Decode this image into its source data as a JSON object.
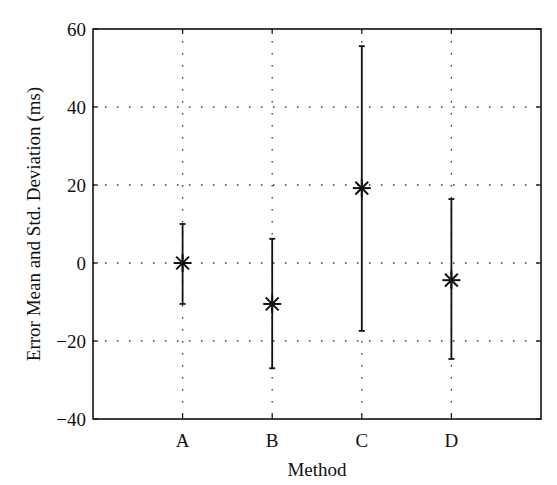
{
  "chart_data": {
    "type": "errorbar",
    "title": "",
    "xlabel": "Method",
    "ylabel": "Error Mean and Std. Deviation (ms)",
    "categories": [
      "A",
      "B",
      "C",
      "D"
    ],
    "series": [
      {
        "name": "Error",
        "marker": "asterisk",
        "mean": [
          0,
          -10.5,
          19.2,
          -4.4
        ],
        "upper": [
          10,
          6.2,
          55.6,
          16.4
        ],
        "lower": [
          -10.5,
          -27,
          -17.4,
          -24.6
        ]
      }
    ],
    "ylim": [
      -40,
      60
    ],
    "xlim": [
      0,
      5
    ],
    "yticks": [
      -40,
      -20,
      0,
      20,
      40,
      60
    ],
    "ytick_labels": [
      "−40",
      "−20",
      "0",
      "20",
      "40",
      "60"
    ],
    "grid": true,
    "grid_style": "dotted",
    "legend": null
  }
}
